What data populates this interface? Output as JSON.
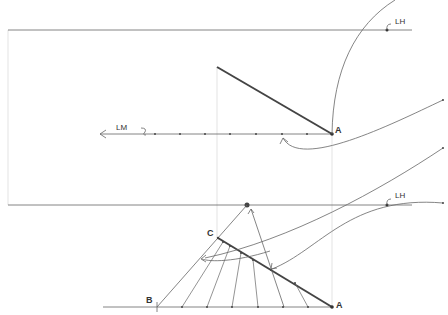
{
  "diagram": {
    "type": "perspective-construction",
    "labels": {
      "lh_top": "LH",
      "lh_bottom": "LH",
      "lm": "LM",
      "point_a_top": "A",
      "point_a_bottom": "A",
      "point_b": "B",
      "point_c": "C"
    },
    "colors": {
      "line": "#555555",
      "bold_line": "#444444",
      "guide": "#d8d8d8",
      "background": "#ffffff"
    },
    "top_view": {
      "horizon_y": 30,
      "measuring_line_y": 134,
      "bold_segment": [
        [
          217,
          67
        ],
        [
          332,
          134
        ]
      ],
      "lm_ticks_x": [
        155,
        180,
        205,
        230,
        256,
        282,
        307
      ]
    },
    "bottom_view": {
      "horizon_y": 205,
      "ground_y": 307,
      "vanishing_point": [
        247,
        205
      ],
      "b_point": [
        157,
        307
      ],
      "c_point": [
        218,
        238
      ],
      "a_point": [
        332,
        307
      ],
      "ground_ticks_x": [
        182,
        207,
        232,
        258,
        283,
        308
      ]
    }
  }
}
